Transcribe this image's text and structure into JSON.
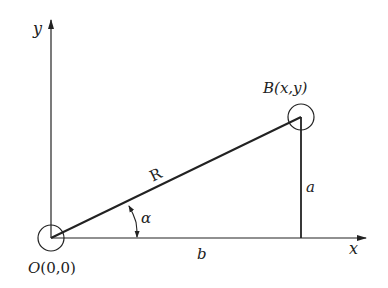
{
  "diagram": {
    "type": "coordinate geometry figure",
    "labels": {
      "y_axis": "y",
      "x_axis": "x",
      "point_B": "B",
      "point_B_coords": "(x,y)",
      "origin": "O",
      "origin_coords": "(0,0)",
      "hypotenuse": "R",
      "angle": "α",
      "vertical_side": "a",
      "horizontal_side": "b"
    },
    "colors": {
      "line": "#222222",
      "background": "#ffffff"
    }
  }
}
